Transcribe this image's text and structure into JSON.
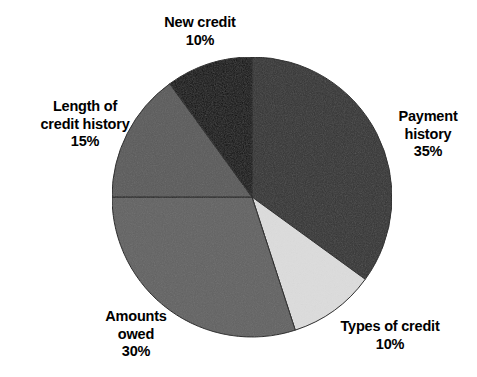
{
  "chart_data": {
    "type": "pie",
    "title": "",
    "subtitle": "",
    "xlabel": "",
    "ylabel": "",
    "legend_position": "none",
    "grid": false,
    "start_angle_deg": 0,
    "direction": "clockwise",
    "units": "percent",
    "total": 100,
    "categories": [
      "Payment history",
      "Types of credit",
      "Amounts owed",
      "Length of credit history",
      "New credit"
    ],
    "values": [
      35,
      10,
      30,
      15,
      10
    ],
    "slices": [
      {
        "label": "Payment history",
        "label_line1": "Payment",
        "label_line2": "history",
        "value": 35,
        "value_text": "35%",
        "color": "#333333",
        "start_deg": 0,
        "end_deg": 126
      },
      {
        "label": "Types of credit",
        "label_line1": "Types of credit",
        "label_line2": "",
        "value": 10,
        "value_text": "10%",
        "color": "#dcdcdc",
        "start_deg": 126,
        "end_deg": 162
      },
      {
        "label": "Amounts owed",
        "label_line1": "Amounts",
        "label_line2": "owed",
        "value": 30,
        "value_text": "30%",
        "color": "#626262",
        "start_deg": 162,
        "end_deg": 270
      },
      {
        "label": "Length of credit history",
        "label_line1": "Length of",
        "label_line2": "credit history",
        "value": 15,
        "value_text": "15%",
        "color": "#5a5a5a",
        "start_deg": 270,
        "end_deg": 324
      },
      {
        "label": "New credit",
        "label_line1": "New credit",
        "label_line2": "",
        "value": 10,
        "value_text": "10%",
        "color": "#0d0d0d",
        "start_deg": 324,
        "end_deg": 360
      }
    ]
  },
  "geometry": {
    "center_x": 252,
    "center_y": 197,
    "radius": 140
  },
  "colors": {
    "background": "#ffffff",
    "label_text": "#000000",
    "slice_outline": "#1a1a1a"
  }
}
